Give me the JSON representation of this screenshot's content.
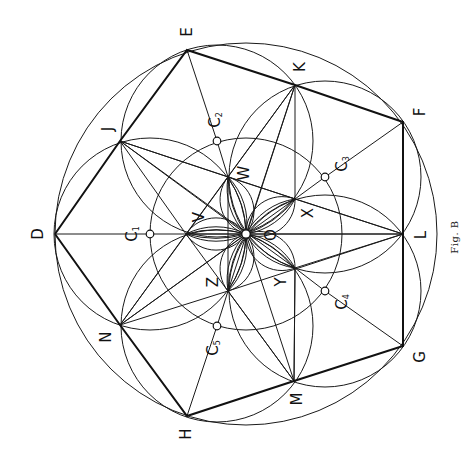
{
  "figure": {
    "caption": "Fig. B",
    "caption_pos": [
      455,
      237
    ],
    "stroke_color": "#111111",
    "background": "#ffffff"
  },
  "points": {
    "O": [
      246,
      234
    ],
    "D": [
      55,
      234
    ],
    "E": [
      187,
      50
    ],
    "F": [
      403,
      122
    ],
    "G": [
      403,
      346
    ],
    "H": [
      187,
      416
    ],
    "J": [
      120,
      141
    ],
    "K": [
      295,
      85
    ],
    "L": [
      403,
      234
    ],
    "M": [
      294,
      381
    ],
    "N": [
      120,
      325
    ],
    "V": [
      186,
      234
    ],
    "W": [
      228,
      177
    ],
    "X": [
      295,
      199
    ],
    "Y": [
      295,
      268
    ],
    "Z": [
      228,
      291
    ],
    "C1": [
      150,
      234
    ],
    "C2": [
      217,
      141
    ],
    "C3": [
      325,
      177
    ],
    "C4": [
      325,
      291
    ],
    "C5": [
      217,
      326
    ]
  },
  "labels": [
    {
      "id": "label-D",
      "text": "D",
      "pos": [
        38,
        234
      ]
    },
    {
      "id": "label-E",
      "text": "E",
      "pos": [
        187,
        32
      ]
    },
    {
      "id": "label-F",
      "text": "F",
      "pos": [
        420,
        112
      ]
    },
    {
      "id": "label-G",
      "text": "G",
      "pos": [
        420,
        357
      ]
    },
    {
      "id": "label-H",
      "text": "H",
      "pos": [
        186,
        434
      ]
    },
    {
      "id": "label-J",
      "text": "J",
      "pos": [
        108,
        129
      ]
    },
    {
      "id": "label-K",
      "text": "K",
      "pos": [
        300,
        67
      ]
    },
    {
      "id": "label-L",
      "text": "L",
      "pos": [
        421,
        235
      ]
    },
    {
      "id": "label-M",
      "text": "M",
      "pos": [
        297,
        399
      ]
    },
    {
      "id": "label-N",
      "text": "N",
      "pos": [
        106,
        337
      ]
    },
    {
      "id": "label-O",
      "text": "O",
      "pos": [
        271,
        235
      ]
    },
    {
      "id": "label-V",
      "text": "V",
      "pos": [
        199,
        217
      ]
    },
    {
      "id": "label-W",
      "text": "W",
      "pos": [
        244,
        173
      ]
    },
    {
      "id": "label-X",
      "text": "X",
      "pos": [
        308,
        213
      ]
    },
    {
      "id": "label-Y",
      "text": "Y",
      "pos": [
        281,
        282
      ]
    },
    {
      "id": "label-Z",
      "text": "Z",
      "pos": [
        213,
        282
      ]
    }
  ],
  "center_labels": [
    {
      "id": "label-C1",
      "text": "C",
      "sub": "1",
      "pos": [
        132,
        234
      ]
    },
    {
      "id": "label-C2",
      "text": "C",
      "sub": "2",
      "pos": [
        215,
        120
      ]
    },
    {
      "id": "label-C3",
      "text": "C",
      "sub": "3",
      "pos": [
        342,
        164
      ]
    },
    {
      "id": "label-C4",
      "text": "C",
      "sub": "4",
      "pos": [
        342,
        302
      ]
    },
    {
      "id": "label-C5",
      "text": "C",
      "sub": "5",
      "pos": [
        213,
        348
      ]
    }
  ],
  "circles": [
    {
      "id": "outer-circle",
      "center": "O",
      "r": 191
    },
    {
      "id": "middle-circle",
      "center": "O",
      "r": 96
    },
    {
      "id": "circle-C1",
      "center": "C1",
      "r": 96
    },
    {
      "id": "circle-C2",
      "center": "C2",
      "r": 96
    },
    {
      "id": "circle-C3",
      "center": "C3",
      "r": 96
    },
    {
      "id": "circle-C4",
      "center": "C4",
      "r": 96
    },
    {
      "id": "circle-C5",
      "center": "C5",
      "r": 96
    }
  ],
  "bold_path": [
    "D",
    "J",
    "E",
    "K",
    "F",
    "L",
    "G",
    "M",
    "H",
    "N",
    "D"
  ],
  "thin_segments": [
    [
      "D",
      "L"
    ],
    [
      "E",
      "C2"
    ],
    [
      "F",
      "C3"
    ],
    [
      "G",
      "C4"
    ],
    [
      "H",
      "C5"
    ],
    [
      "W",
      "Z"
    ],
    [
      "K",
      "X"
    ],
    [
      "Y",
      "M"
    ],
    [
      "F",
      "L"
    ],
    [
      "L",
      "G"
    ],
    [
      "C2",
      "W"
    ],
    [
      "C3",
      "X"
    ],
    [
      "C4",
      "Y"
    ],
    [
      "C5",
      "Z"
    ],
    [
      "J",
      "V"
    ],
    [
      "J",
      "W"
    ],
    [
      "J",
      "Y"
    ],
    [
      "J",
      "O"
    ],
    [
      "K",
      "W"
    ],
    [
      "K",
      "V"
    ],
    [
      "K",
      "Z"
    ],
    [
      "K",
      "O"
    ],
    [
      "L",
      "X"
    ],
    [
      "L",
      "Y"
    ],
    [
      "L",
      "W"
    ],
    [
      "L",
      "Z"
    ],
    [
      "M",
      "Y"
    ],
    [
      "M",
      "Z"
    ],
    [
      "M",
      "V"
    ],
    [
      "M",
      "O"
    ],
    [
      "N",
      "V"
    ],
    [
      "N",
      "Z"
    ],
    [
      "N",
      "W"
    ],
    [
      "N",
      "X"
    ],
    [
      "N",
      "O"
    ],
    [
      "J",
      "X"
    ],
    [
      "L",
      "V"
    ]
  ],
  "petals": [
    "V",
    "W",
    "X",
    "Y",
    "Z"
  ],
  "markers": [
    "O",
    "C1",
    "C2",
    "C3",
    "C4",
    "C5"
  ]
}
